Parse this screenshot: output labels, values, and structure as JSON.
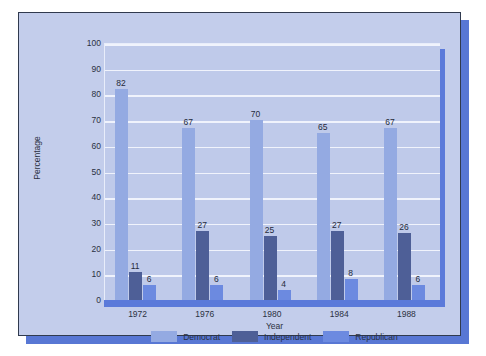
{
  "chart_data": {
    "type": "bar",
    "title": "",
    "xlabel": "Year",
    "ylabel": "Percentage",
    "categories": [
      "1972",
      "1976",
      "1980",
      "1984",
      "1988"
    ],
    "series": [
      {
        "name": "Democrat",
        "color": "#94aae2",
        "values": [
          82,
          67,
          70,
          65,
          67
        ]
      },
      {
        "name": "Independent",
        "color": "#4e5f97",
        "values": [
          11,
          27,
          25,
          27,
          26
        ]
      },
      {
        "name": "Republican",
        "color": "#6c8ae0",
        "values": [
          6,
          6,
          4,
          8,
          6
        ]
      }
    ],
    "ylim": [
      0,
      100
    ],
    "yticks": [
      "0",
      "10",
      "20",
      "30",
      "40",
      "50",
      "60",
      "70",
      "80",
      "90",
      "100"
    ],
    "grid": true,
    "legend_position": "bottom",
    "data_labels": true
  },
  "colors": {
    "frame_background": "#c3cdeb",
    "frame_border": "#303a4e",
    "frame_shadow": "#5877d4",
    "plot_background": "#bfcaea",
    "plot_shadow": "#5b7ada",
    "gridline": "#f0f3fc",
    "axis_line": "#5b7ada",
    "text": "#2b3142"
  }
}
